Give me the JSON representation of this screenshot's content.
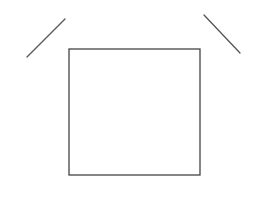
{
  "diagram": {
    "background": "#ffffff",
    "stroke_color": "#555555",
    "shapes": {
      "square": {
        "x": 69,
        "y": 49,
        "width": 131,
        "height": 126
      },
      "left_line": {
        "x1": 27,
        "y1": 57,
        "x2": 65,
        "y2": 19
      },
      "right_line": {
        "x1": 204,
        "y1": 15,
        "x2": 240,
        "y2": 53
      }
    }
  }
}
